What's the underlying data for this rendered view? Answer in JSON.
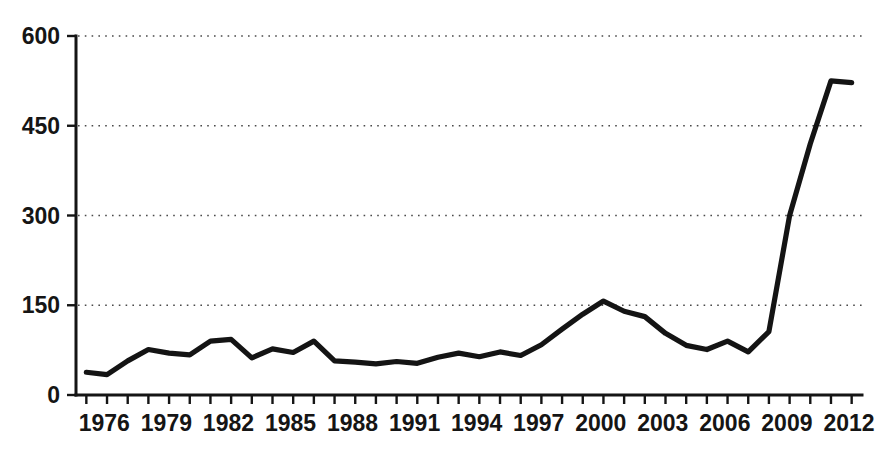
{
  "chart_data": {
    "type": "line",
    "title": "",
    "subtitle": "",
    "xlabel": "",
    "ylabel": "",
    "xlim": [
      1975.5,
      2013.5
    ],
    "ylim": [
      0,
      600
    ],
    "grid": true,
    "legend": "none",
    "y_ticks": [
      0,
      150,
      300,
      450,
      600
    ],
    "y_tick_labels": [
      "0",
      "150",
      "300",
      "450",
      "600"
    ],
    "x_ticks": [
      1976,
      1977,
      1978,
      1979,
      1980,
      1981,
      1982,
      1983,
      1984,
      1985,
      1986,
      1987,
      1988,
      1989,
      1990,
      1991,
      1992,
      1993,
      1994,
      1995,
      1996,
      1997,
      1998,
      1999,
      2000,
      2001,
      2002,
      2003,
      2004,
      2005,
      2006,
      2007,
      2008,
      2009,
      2010,
      2011,
      2012,
      2013
    ],
    "x_tick_labels": [
      "1976",
      "1979",
      "1982",
      "1985",
      "1988",
      "1991",
      "1994",
      "1997",
      "2000",
      "2003",
      "2006",
      "2009",
      "2012"
    ],
    "x_labeled_ticks": [
      1976,
      1979,
      1982,
      1985,
      1988,
      1991,
      1994,
      1997,
      2000,
      2003,
      2006,
      2009,
      2012
    ],
    "line_color": "#141414",
    "grid_color": "#4a4a4a",
    "axis_color": "#151515",
    "x": [
      1976,
      1977,
      1978,
      1979,
      1980,
      1981,
      1982,
      1983,
      1984,
      1985,
      1986,
      1987,
      1988,
      1989,
      1990,
      1991,
      1992,
      1993,
      1994,
      1995,
      1996,
      1997,
      1998,
      1999,
      2000,
      2001,
      2002,
      2003,
      2004,
      2005,
      2006,
      2007,
      2008,
      2009,
      2010,
      2011,
      2012,
      2013
    ],
    "values": [
      38,
      34,
      57,
      76,
      70,
      67,
      90,
      93,
      62,
      77,
      71,
      90,
      57,
      55,
      52,
      56,
      53,
      63,
      70,
      64,
      72,
      66,
      84,
      110,
      135,
      157,
      140,
      131,
      103,
      83,
      76,
      90,
      72,
      106,
      300,
      420,
      525,
      522
    ],
    "series": [
      {
        "name": "value",
        "values": [
          38,
          34,
          57,
          76,
          70,
          67,
          90,
          93,
          62,
          77,
          71,
          90,
          57,
          55,
          52,
          56,
          53,
          63,
          70,
          64,
          72,
          66,
          84,
          110,
          135,
          157,
          140,
          131,
          103,
          83,
          76,
          90,
          72,
          106,
          300,
          420,
          525,
          522
        ]
      }
    ],
    "annotations": []
  },
  "figure": {
    "width": 879,
    "height": 459,
    "background": "#ffffff",
    "plot_left": 76,
    "plot_right": 862,
    "plot_top": 36,
    "plot_bottom": 395
  }
}
